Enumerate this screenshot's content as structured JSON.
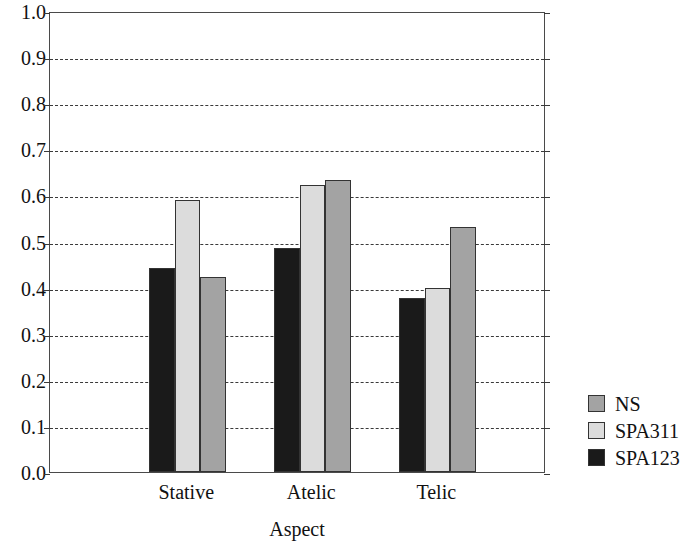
{
  "chart_data": {
    "type": "bar",
    "title": "",
    "xlabel": "Aspect",
    "ylabel": "",
    "categories": [
      "Stative",
      "Atelic",
      "Telic"
    ],
    "series": [
      {
        "name": "SPA123",
        "color": "#1a1a1a",
        "values": [
          0.443,
          0.487,
          0.377
        ]
      },
      {
        "name": "SPA311",
        "color": "#dcdcdc",
        "values": [
          0.589,
          0.623,
          0.399
        ]
      },
      {
        "name": "NS",
        "color": "#a3a3a3",
        "values": [
          0.424,
          0.634,
          0.531
        ]
      }
    ],
    "ylim": [
      0.0,
      1.0
    ],
    "ytick_labels": [
      "1.0",
      "0.9",
      "0.8",
      "0.7",
      "0.6",
      "0.5",
      "0.4",
      "0.3",
      "0.2",
      "0.1",
      "0.0"
    ],
    "ytick_values": [
      1.0,
      0.9,
      0.8,
      0.7,
      0.6,
      0.5,
      0.4,
      0.3,
      0.2,
      0.1,
      0.0
    ],
    "grid": true,
    "grid_style": "dashed-horizontal",
    "legend_position": "right",
    "legend_entries": [
      {
        "label": "NS",
        "color": "#a3a3a3"
      },
      {
        "label": "SPA311",
        "color": "#dcdcdc"
      },
      {
        "label": "SPA123",
        "color": "#1a1a1a"
      }
    ]
  }
}
